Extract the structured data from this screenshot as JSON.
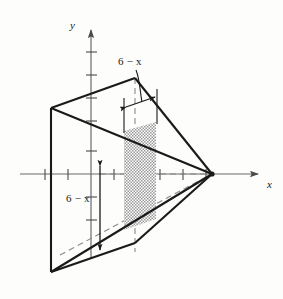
{
  "figure": {
    "background_color": "#fdfdfc",
    "ink_color": "#1a1a1a",
    "shade_color": "#b4b4b4"
  },
  "axes": {
    "x_axis": {
      "label": "x",
      "name": "x-axis",
      "arrow": "right",
      "y_pixel": 174,
      "x_start": 20,
      "x_end": 266,
      "tick_pixels": [
        45,
        68,
        91,
        114,
        137,
        160,
        183,
        206
      ],
      "origin_pixel": 91
    },
    "y_axis": {
      "label": "y",
      "name": "y-axis",
      "arrow": "up",
      "x_pixel": 91,
      "y_start": 26,
      "y_end": 258,
      "tick_pixels": [
        52,
        75,
        98,
        121,
        151,
        197,
        220
      ]
    }
  },
  "annotations": {
    "cross_section_width": {
      "text": "6 − x",
      "name": "cross-section-width-label",
      "describes": "width of the square cross section, measured horizontally at the top of the shaded slab"
    },
    "cross_section_height": {
      "text": "6 − x",
      "name": "cross-section-height-label",
      "describes": "height of the square cross section, measured vertically by the double headed arrow"
    }
  },
  "geometry": {
    "back_square_face": {
      "name": "back-square-face",
      "points": "51,108 135,78 135,243 51,272",
      "description": "left square face of the solid drawn in perspective"
    },
    "apex": {
      "x": 212,
      "y": 174,
      "name": "apex-point"
    },
    "shaded_slab": {
      "name": "shaded-cross-section",
      "points": "124,131 156,122 156,219 124,230",
      "fill": "#b4b4b4",
      "description": "representative square cross section perpendicular to the x axis"
    },
    "solid_edges": [
      {
        "name": "edge-top-back",
        "from": "51,108",
        "to": "135,78"
      },
      {
        "name": "edge-left-vertical",
        "from": "51,108",
        "to": "51,272"
      },
      {
        "name": "edge-top-ridge-to-apex",
        "from": "135,78",
        "to": "212,174"
      },
      {
        "name": "edge-topleft-to-apex",
        "from": "51,108",
        "to": "212,174"
      },
      {
        "name": "edge-bottomleft-to-apex",
        "from": "51,272",
        "to": "212,174"
      },
      {
        "name": "edge-bottom-front",
        "from": "51,272",
        "to": "135,243"
      },
      {
        "name": "edge-bottom-ridge-to-apex",
        "from": "135,243",
        "to": "212,174"
      }
    ],
    "hidden_edges": [
      {
        "name": "hidden-edge-vertical-back",
        "from": "135,78",
        "to": "135,243"
      },
      {
        "name": "hidden-edge-to-apex",
        "from": "51,272",
        "to": "212,174"
      }
    ]
  }
}
